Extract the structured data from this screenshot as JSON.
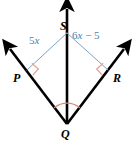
{
  "figure": {
    "type": "geometry-diagram",
    "colors": {
      "ray_stroke": "#000000",
      "segment_stroke": "#7ba2c4",
      "label_text": "#000000",
      "segment_label_text": "#4b7fae",
      "right_angle_mark": "#e8a396",
      "angle_arc_mark": "#d98b7a",
      "background": "#ffffff"
    },
    "points": {
      "P": {
        "label": "P",
        "x": 27,
        "y": 70
      },
      "Q": {
        "label": "Q",
        "x": 67,
        "y": 124
      },
      "R": {
        "label": "R",
        "x": 108,
        "y": 70
      },
      "S": {
        "label": "S",
        "x": 67,
        "y": 33
      }
    },
    "rays": [
      {
        "name": "ray-QP",
        "from": "Q",
        "through": "P",
        "arrow": "end"
      },
      {
        "name": "ray-QR",
        "from": "Q",
        "through": "R",
        "arrow": "end"
      },
      {
        "name": "ray-QS",
        "from": "Q",
        "through": "S",
        "arrow": "end"
      }
    ],
    "segments": [
      {
        "name": "segment-SP",
        "from": "S",
        "to": "P",
        "label": "5x"
      },
      {
        "name": "segment-SR",
        "from": "S",
        "to": "R",
        "label": "6x − 5"
      }
    ],
    "marks": {
      "right_angle_at_P": "right-angle-square",
      "right_angle_at_R": "right-angle-square",
      "angle_arc_at_Q": "single-arc"
    }
  },
  "labels": {
    "point_P": "P",
    "point_Q": "Q",
    "point_R": "R",
    "point_S": "S",
    "left_segment": "5x",
    "left_segment_coefficient": "5",
    "left_segment_variable": "x",
    "right_segment": "6x − 5",
    "right_segment_coefficient": "6",
    "right_segment_variable": "x",
    "right_segment_constant": "− 5"
  }
}
